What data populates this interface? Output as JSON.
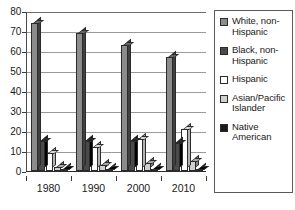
{
  "chart_data": {
    "type": "bar",
    "title": "",
    "xlabel": "",
    "ylabel": "",
    "ylim": [
      0,
      80
    ],
    "yticks": [
      0,
      10,
      20,
      30,
      40,
      50,
      60,
      70,
      80
    ],
    "grid": true,
    "legend_position": "right",
    "categories": [
      "1980",
      "1990",
      "2000",
      "2010"
    ],
    "series": [
      {
        "name": "White, non-Hispanic",
        "color": "#8c8c8c",
        "values": [
          74,
          69,
          63,
          57
        ]
      },
      {
        "name": "Black, non-Hispanic",
        "color": "#4a4a4a",
        "values": [
          15,
          15,
          15,
          14
        ]
      },
      {
        "name": "Hispanic",
        "color": "#ffffff",
        "values": [
          9,
          12,
          16,
          21
        ]
      },
      {
        "name": "Asian/Pacific Islander",
        "color": "#cfcfcf",
        "values": [
          2,
          3,
          4,
          5
        ]
      },
      {
        "name": "Native American",
        "color": "#1a1a1a",
        "values": [
          1,
          1,
          1,
          1
        ]
      }
    ]
  },
  "legend": {
    "items": [
      {
        "label": "White, non-Hispanic",
        "color": "#8c8c8c"
      },
      {
        "label": "Black, non-Hispanic",
        "color": "#4a4a4a"
      },
      {
        "label": "Hispanic",
        "color": "#ffffff"
      },
      {
        "label": "Asian/Pacific Islander",
        "color": "#cfcfcf"
      },
      {
        "label": "Native American",
        "color": "#1a1a1a"
      }
    ]
  }
}
